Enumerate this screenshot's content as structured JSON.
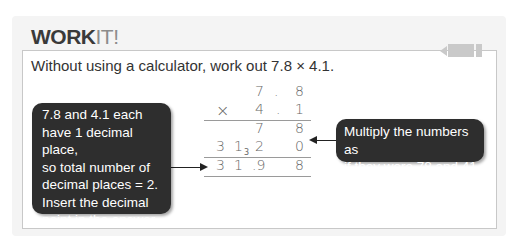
{
  "header": {
    "title_bold": "WORK",
    "title_light": "IT!"
  },
  "question": "Without using a calculator, work out 7.8 × 4.1.",
  "callouts": {
    "left": [
      "7.8 and 4.1 each",
      "have 1 decimal place,",
      "so total number of",
      "decimal places = 2.",
      "Insert the decimal",
      "point in the answer."
    ],
    "right": [
      "Multiply the numbers as",
      "if they were 78 and 41."
    ]
  },
  "working": {
    "row1": {
      "tens": "7",
      "dot": ".",
      "units": "8"
    },
    "row2": {
      "op": "×",
      "tens": "4",
      "dot": ".",
      "units": "1"
    },
    "row3": {
      "tens": "7",
      "units": "8"
    },
    "row4": {
      "hundreds": "3",
      "tens": "1",
      "carry": "3",
      "ones": "2",
      "units": "0"
    },
    "row5": {
      "hundreds": "3",
      "tens": "1",
      "ones": ".9",
      "units": "8"
    }
  },
  "icons": {
    "tab": "pencil-tab-icon"
  }
}
